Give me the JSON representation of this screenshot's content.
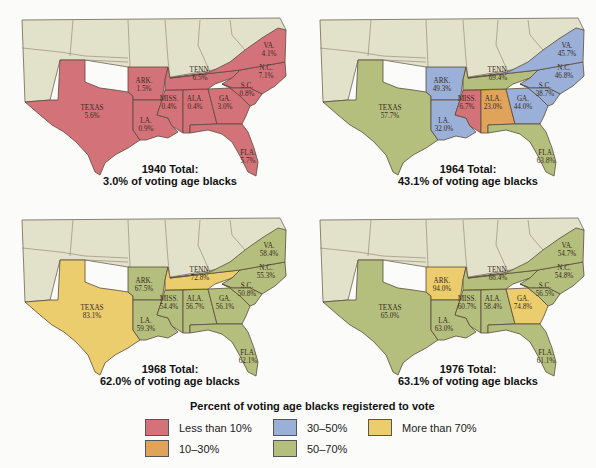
{
  "colors": {
    "lt10": "#d4727a",
    "10to30": "#e0a35a",
    "30to50": "#9bb0d8",
    "50to70": "#b4bf7d",
    "gt70": "#ebcd6d",
    "other_states": "#e2e1c9",
    "border": "#5a4a3a"
  },
  "maps": [
    {
      "year": "1940",
      "caption_line1": "1940 Total:",
      "caption_line2": "3.0% of voting age blacks",
      "states": {
        "TEXAS": {
          "name": "TEXAS",
          "value": "5.6%",
          "cat": "lt10"
        },
        "ARK": {
          "name": "ARK.",
          "value": "1.5%",
          "cat": "lt10"
        },
        "LA": {
          "name": "LA.",
          "value": "0.9%",
          "cat": "lt10"
        },
        "MISS": {
          "name": "MISS.",
          "value": "0.4%",
          "cat": "lt10"
        },
        "ALA": {
          "name": "ALA.",
          "value": "0.4%",
          "cat": "lt10"
        },
        "GA": {
          "name": "GA.",
          "value": "3.0%",
          "cat": "lt10"
        },
        "TENN": {
          "name": "TENN.",
          "value": "6.5%",
          "cat": "lt10"
        },
        "NC": {
          "name": "N.C.",
          "value": "7.1%",
          "cat": "lt10"
        },
        "SC": {
          "name": "S.C.",
          "value": "0.8%",
          "cat": "lt10"
        },
        "VA": {
          "name": "VA.",
          "value": "4.1%",
          "cat": "lt10"
        },
        "FLA": {
          "name": "FLA.",
          "value": "5.7%",
          "cat": "lt10"
        }
      }
    },
    {
      "year": "1964",
      "caption_line1": "1964 Total:",
      "caption_line2": "43.1% of voting age blacks",
      "states": {
        "TEXAS": {
          "name": "TEXAS",
          "value": "57.7%",
          "cat": "50to70"
        },
        "ARK": {
          "name": "ARK.",
          "value": "49.3%",
          "cat": "30to50"
        },
        "LA": {
          "name": "LA.",
          "value": "32.0%",
          "cat": "30to50"
        },
        "MISS": {
          "name": "MISS.",
          "value": "6.7%",
          "cat": "lt10"
        },
        "ALA": {
          "name": "ALA.",
          "value": "23.0%",
          "cat": "10to30"
        },
        "GA": {
          "name": "GA.",
          "value": "44.0%",
          "cat": "30to50"
        },
        "TENN": {
          "name": "TENN.",
          "value": "69.4%",
          "cat": "50to70"
        },
        "NC": {
          "name": "N.C.",
          "value": "46.8%",
          "cat": "30to50"
        },
        "SC": {
          "name": "S.C.",
          "value": "38.7%",
          "cat": "30to50"
        },
        "VA": {
          "name": "VA.",
          "value": "45.7%",
          "cat": "30to50"
        },
        "FLA": {
          "name": "FLA.",
          "value": "63.8%",
          "cat": "50to70"
        }
      }
    },
    {
      "year": "1968",
      "caption_line1": "1968 Total:",
      "caption_line2": "62.0% of voting age blacks",
      "states": {
        "TEXAS": {
          "name": "TEXAS",
          "value": "83.1%",
          "cat": "gt70"
        },
        "ARK": {
          "name": "ARK.",
          "value": "67.5%",
          "cat": "50to70"
        },
        "LA": {
          "name": "LA.",
          "value": "59.3%",
          "cat": "50to70"
        },
        "MISS": {
          "name": "MISS.",
          "value": "54.4%",
          "cat": "50to70"
        },
        "ALA": {
          "name": "ALA.",
          "value": "56.7%",
          "cat": "50to70"
        },
        "GA": {
          "name": "GA.",
          "value": "56.1%",
          "cat": "50to70"
        },
        "TENN": {
          "name": "TENN.",
          "value": "72.8%",
          "cat": "gt70"
        },
        "NC": {
          "name": "N.C.",
          "value": "55.3%",
          "cat": "50to70"
        },
        "SC": {
          "name": "S.C.",
          "value": "50.8%",
          "cat": "50to70"
        },
        "VA": {
          "name": "VA.",
          "value": "58.4%",
          "cat": "50to70"
        },
        "FLA": {
          "name": "FLA.",
          "value": "62.1%",
          "cat": "50to70"
        }
      }
    },
    {
      "year": "1976",
      "caption_line1": "1976 Total:",
      "caption_line2": "63.1% of voting age blacks",
      "states": {
        "TEXAS": {
          "name": "TEXAS",
          "value": "65.0%",
          "cat": "50to70"
        },
        "ARK": {
          "name": "ARK.",
          "value": "94.0%",
          "cat": "gt70"
        },
        "LA": {
          "name": "LA.",
          "value": "63.0%",
          "cat": "50to70"
        },
        "MISS": {
          "name": "MISS.",
          "value": "60.7%",
          "cat": "50to70"
        },
        "ALA": {
          "name": "ALA.",
          "value": "58.4%",
          "cat": "50to70"
        },
        "GA": {
          "name": "GA.",
          "value": "74.8%",
          "cat": "gt70"
        },
        "TENN": {
          "name": "TENN.",
          "value": "66.4%",
          "cat": "50to70"
        },
        "NC": {
          "name": "N.C.",
          "value": "54.8%",
          "cat": "50to70"
        },
        "SC": {
          "name": "S.C.",
          "value": "56.5%",
          "cat": "50to70"
        },
        "VA": {
          "name": "VA.",
          "value": "54.7%",
          "cat": "50to70"
        },
        "FLA": {
          "name": "FLA.",
          "value": "61.1%",
          "cat": "50to70"
        }
      }
    }
  ],
  "legend": {
    "title": "Percent of voting age blacks registered to vote",
    "items": [
      {
        "key": "lt10",
        "label": "Less than 10%"
      },
      {
        "key": "10to30",
        "label": "10–30%"
      },
      {
        "key": "30to50",
        "label": "30–50%"
      },
      {
        "key": "50to70",
        "label": "50–70%"
      },
      {
        "key": "gt70",
        "label": "More than 70%"
      }
    ]
  }
}
